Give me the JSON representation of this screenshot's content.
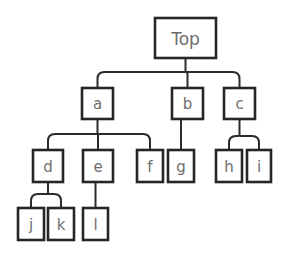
{
  "diagram": {
    "type": "tree",
    "background_color": "#ffffff",
    "box_fill_color": "#ffffff",
    "box_border_color": "#262626",
    "edge_color": "#2b2b2b",
    "label_color": "#6e6e6e",
    "root_label": "Top",
    "nodes": [
      {
        "id": "top",
        "label": "Top",
        "x": 155,
        "y": 18,
        "w": 61,
        "h": 40,
        "font_size": 17,
        "level": 0,
        "parent": null
      },
      {
        "id": "a",
        "label": "a",
        "x": 82,
        "y": 88,
        "w": 31,
        "h": 31,
        "font_size": 15,
        "level": 1,
        "parent": "top"
      },
      {
        "id": "b",
        "label": "b",
        "x": 172,
        "y": 88,
        "w": 31,
        "h": 31,
        "font_size": 15,
        "level": 1,
        "parent": "top"
      },
      {
        "id": "c",
        "label": "c",
        "x": 224,
        "y": 88,
        "w": 31,
        "h": 31,
        "font_size": 15,
        "level": 1,
        "parent": "top"
      },
      {
        "id": "d",
        "label": "d",
        "x": 33,
        "y": 150,
        "w": 30,
        "h": 32,
        "font_size": 15,
        "level": 2,
        "parent": "a"
      },
      {
        "id": "e",
        "label": "e",
        "x": 83,
        "y": 150,
        "w": 30,
        "h": 32,
        "font_size": 15,
        "level": 2,
        "parent": "a"
      },
      {
        "id": "f",
        "label": "f",
        "x": 137,
        "y": 150,
        "w": 26,
        "h": 32,
        "font_size": 15,
        "level": 2,
        "parent": "a"
      },
      {
        "id": "g",
        "label": "g",
        "x": 168,
        "y": 150,
        "w": 26,
        "h": 32,
        "font_size": 15,
        "level": 2,
        "parent": "b"
      },
      {
        "id": "h",
        "label": "h",
        "x": 216,
        "y": 150,
        "w": 26,
        "h": 32,
        "font_size": 15,
        "level": 2,
        "parent": "c"
      },
      {
        "id": "i",
        "label": "i",
        "x": 247,
        "y": 150,
        "w": 24,
        "h": 32,
        "font_size": 15,
        "level": 2,
        "parent": "c"
      },
      {
        "id": "j",
        "label": "j",
        "x": 18,
        "y": 208,
        "w": 26,
        "h": 32,
        "font_size": 15,
        "level": 3,
        "parent": "d"
      },
      {
        "id": "k",
        "label": "k",
        "x": 48,
        "y": 208,
        "w": 26,
        "h": 32,
        "font_size": 15,
        "level": 3,
        "parent": "d"
      },
      {
        "id": "l",
        "label": "l",
        "x": 83,
        "y": 208,
        "w": 25,
        "h": 32,
        "font_size": 15,
        "level": 3,
        "parent": "e"
      }
    ],
    "edge_groups": [
      {
        "id": "top-children",
        "parent": "top",
        "children": [
          "a",
          "b",
          "c"
        ],
        "bus_y": 72,
        "parent_bottom_y": 58,
        "child_top_y": 88,
        "parent_cx": 185.5,
        "child_cx": [
          97.5,
          187.5,
          239.5
        ],
        "corner_radius": 7
      },
      {
        "id": "a-children",
        "parent": "a",
        "children": [
          "d",
          "e",
          "f"
        ],
        "bus_y": 134,
        "parent_bottom_y": 119,
        "child_top_y": 150,
        "parent_cx": 97.5,
        "child_cx": [
          48,
          98,
          150
        ],
        "corner_radius": 7
      },
      {
        "id": "b-children",
        "parent": "b",
        "children": [
          "g"
        ],
        "bus_y": 134,
        "parent_bottom_y": 119,
        "child_top_y": 150,
        "parent_cx": 181,
        "child_cx": [
          181
        ],
        "corner_radius": 0
      },
      {
        "id": "c-children",
        "parent": "c",
        "children": [
          "h",
          "i"
        ],
        "bus_y": 136,
        "parent_bottom_y": 119,
        "child_top_y": 150,
        "parent_cx": 239.5,
        "child_cx": [
          229,
          259
        ],
        "corner_radius": 7
      },
      {
        "id": "d-children",
        "parent": "d",
        "children": [
          "j",
          "k"
        ],
        "bus_y": 194,
        "parent_bottom_y": 182,
        "child_top_y": 208,
        "parent_cx": 48,
        "child_cx": [
          31,
          61
        ],
        "corner_radius": 7
      },
      {
        "id": "e-children",
        "parent": "e",
        "children": [
          "l"
        ],
        "bus_y": 194,
        "parent_bottom_y": 182,
        "child_top_y": 208,
        "parent_cx": 95.5,
        "child_cx": [
          95.5
        ],
        "corner_radius": 0
      }
    ]
  }
}
